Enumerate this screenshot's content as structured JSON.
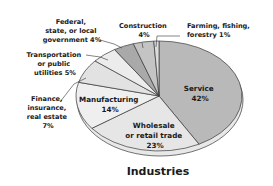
{
  "chart_data": {
    "type": "pie",
    "title": "Industries",
    "categories": [
      "Service",
      "Wholesale or retail trade",
      "Manufacturing",
      "Finance, insurance, real estate",
      "Transportation or public utilities",
      "Federal, state, or local government",
      "Construction",
      "Farming, fishing, forestry"
    ],
    "values": [
      42,
      23,
      14,
      7,
      5,
      4,
      4,
      1
    ],
    "unit": "%",
    "colors": [
      "#b9b9b9",
      "#e6e6e6",
      "#efefef",
      "#e2e2e2",
      "#ececec",
      "#a9a9a9",
      "#c4c4c4",
      "#dcdcdc"
    ],
    "start_angle_deg": 0,
    "direction": "clockwise"
  },
  "title": "Industries",
  "labels": {
    "service": [
      "Service",
      "42%"
    ],
    "wholesale": [
      "Wholesale",
      "or retail trade",
      "23%"
    ],
    "manufacturing": [
      "Manufacturing",
      "14%"
    ],
    "finance": [
      "Finance,",
      "insurance,",
      "real estate",
      "7%"
    ],
    "transportation": [
      "Transportation",
      "or public",
      "utilities 5%"
    ],
    "government": [
      "Federal,",
      "state, or local",
      "government 4%"
    ],
    "construction": [
      "Construction",
      "4%"
    ],
    "farming": [
      "Farming, fishing,",
      "forestry 1%"
    ]
  }
}
